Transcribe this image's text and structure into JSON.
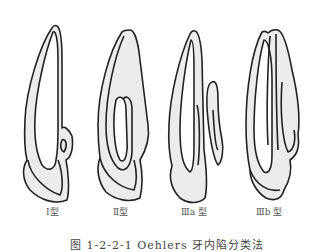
{
  "figure": {
    "types": [
      {
        "id": "type-1",
        "label": "Ⅰ型"
      },
      {
        "id": "type-2",
        "label": "Ⅱ型"
      },
      {
        "id": "type-3a",
        "label": "Ⅲa 型"
      },
      {
        "id": "type-3b",
        "label": "Ⅲb 型"
      }
    ],
    "caption": "图 1-2-2-1  Oehlers 牙内陷分类法",
    "colors": {
      "fill": "#ececec",
      "stroke": "#222222",
      "background": "#ffffff"
    }
  }
}
